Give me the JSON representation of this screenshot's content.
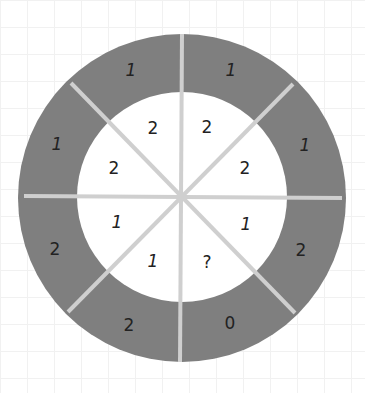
{
  "puzzle": {
    "description": "Circular number puzzle with 8 sectors; outer ring (gray) and inner disc (white)",
    "colors": {
      "ring": "#7f7f7f",
      "inner": "#ffffff",
      "divider": "#cfcfcf",
      "text": "#222222"
    },
    "sectors": [
      {
        "position": "top-left",
        "outer": "1",
        "inner": "2"
      },
      {
        "position": "top-right",
        "outer": "1",
        "inner": "2"
      },
      {
        "position": "right-top",
        "outer": "1",
        "inner": "2"
      },
      {
        "position": "right-bottom",
        "outer": "2",
        "inner": "1"
      },
      {
        "position": "bottom-right",
        "outer": "0",
        "inner": "?"
      },
      {
        "position": "bottom-left",
        "outer": "2",
        "inner": "1"
      },
      {
        "position": "left-bottom",
        "outer": "2",
        "inner": "1"
      },
      {
        "position": "left-top",
        "outer": "1",
        "inner": "2"
      }
    ]
  }
}
